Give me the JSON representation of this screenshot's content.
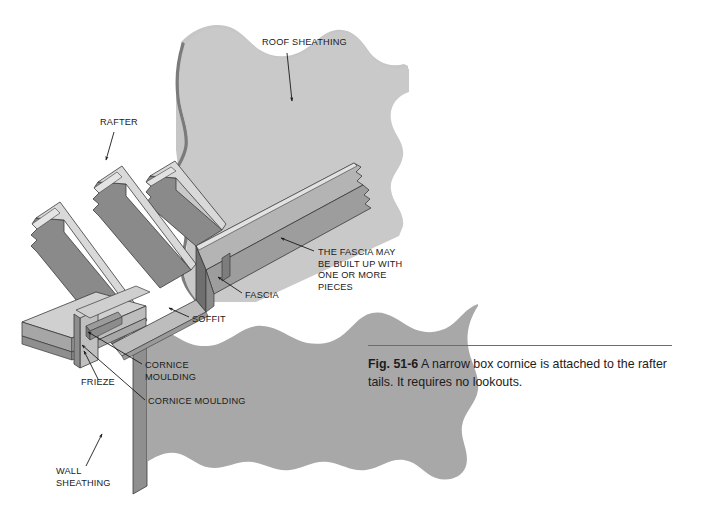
{
  "figure": {
    "number": "Fig. 51-6",
    "caption": "A narrow box cornice is attached to the rafter tails. It requires no lookouts."
  },
  "colors": {
    "background": "#ffffff",
    "sheathing_fill": "#aaaaaa",
    "sheathing_top_fill": "#c9c9c9",
    "wood_face_dark": "#8a8a8a",
    "wood_face_mid": "#b4b4b4",
    "wood_face_light": "#d8d8d8",
    "wood_edge_highlight": "#e4e4e4",
    "outline": "#3a3a3a",
    "text": "#1a1a1a",
    "rule": "#6d6d6d"
  },
  "callouts": [
    {
      "id": "roof-sheathing",
      "label": "ROOF SHEATHING",
      "lines": [
        "ROOF SHEATHING"
      ],
      "text_x": 262,
      "text_y": 45,
      "anchor": "start",
      "leader": [
        [
          287,
          53
        ],
        [
          292,
          101
        ]
      ],
      "arrow_at": [
        291,
        104
      ],
      "arrow_angle": 95
    },
    {
      "id": "rafter",
      "label": "RAFTER",
      "lines": [
        "RAFTER"
      ],
      "text_x": 100,
      "text_y": 125,
      "anchor": "start",
      "leader": [
        [
          114,
          132
        ],
        [
          106,
          160
        ]
      ],
      "arrow_at": [
        105,
        163
      ],
      "arrow_angle": 253
    },
    {
      "id": "fascia-built-up-note",
      "label": "THE FASCIA MAY BE BUILT UP WITH ONE OR MORE PIECES",
      "lines": [
        "THE FASCIA MAY",
        "BE BUILT UP WITH",
        "ONE OR MORE",
        "PIECES"
      ],
      "text_x": 318,
      "text_y": 255,
      "anchor": "start",
      "leader": [
        [
          314,
          251
        ],
        [
          281,
          238
        ]
      ],
      "arrow_at": [
        278,
        237
      ],
      "arrow_angle": 202
    },
    {
      "id": "fascia",
      "label": "FASCIA",
      "lines": [
        "FASCIA"
      ],
      "text_x": 245,
      "text_y": 298,
      "anchor": "start",
      "leader": [
        [
          242,
          293
        ],
        [
          218,
          277
        ]
      ],
      "arrow_at": [
        215,
        275
      ],
      "arrow_angle": 213
    },
    {
      "id": "soffit",
      "label": "SOFFIT",
      "lines": [
        "SOFFIT"
      ],
      "text_x": 192,
      "text_y": 322,
      "anchor": "start",
      "leader": [
        [
          189,
          317
        ],
        [
          169,
          308
        ]
      ],
      "arrow_at": [
        166,
        307
      ],
      "arrow_angle": 205
    },
    {
      "id": "cornice-moulding-upper",
      "label": "CORNICE MOULDING",
      "lines": [
        "CORNICE",
        "MOULDING"
      ],
      "text_x": 145,
      "text_y": 368,
      "anchor": "start",
      "leader": [
        [
          142,
          364
        ],
        [
          88,
          332
        ]
      ],
      "arrow_at": [
        85,
        330
      ],
      "arrow_angle": 211
    },
    {
      "id": "cornice-moulding-lower",
      "label": "CORNICE MOULDING",
      "lines": [
        "CORNICE MOULDING"
      ],
      "text_x": 148,
      "text_y": 404,
      "anchor": "start",
      "leader": [
        [
          145,
          400
        ],
        [
          82,
          345
        ]
      ],
      "arrow_at": [
        79,
        343
      ],
      "arrow_angle": 221
    },
    {
      "id": "frieze",
      "label": "FRIEZE",
      "lines": [
        "FRIEZE"
      ],
      "text_x": 81,
      "text_y": 385,
      "anchor": "start",
      "leader": [
        [
          98,
          379
        ],
        [
          84,
          351
        ]
      ],
      "arrow_at": [
        82,
        348
      ],
      "arrow_angle": 243
    },
    {
      "id": "wall-sheathing",
      "label": "WALL SHEATHING",
      "lines": [
        "WALL",
        "SHEATHING"
      ],
      "text_x": 56,
      "text_y": 474,
      "anchor": "start",
      "leader": [
        [
          86,
          466
        ],
        [
          102,
          434
        ]
      ],
      "arrow_at": [
        104,
        431
      ],
      "arrow_angle": 297
    }
  ],
  "parts": [
    {
      "id": "roof-sheathing-panel",
      "name": "roof-sheathing"
    },
    {
      "id": "rafter-1",
      "name": "rafter-front"
    },
    {
      "id": "rafter-2",
      "name": "rafter-middle"
    },
    {
      "id": "rafter-3",
      "name": "rafter-back"
    },
    {
      "id": "fascia-board",
      "name": "fascia"
    },
    {
      "id": "soffit-panel",
      "name": "soffit"
    },
    {
      "id": "cornice-moulding",
      "name": "cornice-moulding"
    },
    {
      "id": "frieze-board",
      "name": "frieze"
    },
    {
      "id": "wall-sheathing-panel",
      "name": "wall-sheathing"
    },
    {
      "id": "top-plate",
      "name": "top-plate"
    }
  ]
}
